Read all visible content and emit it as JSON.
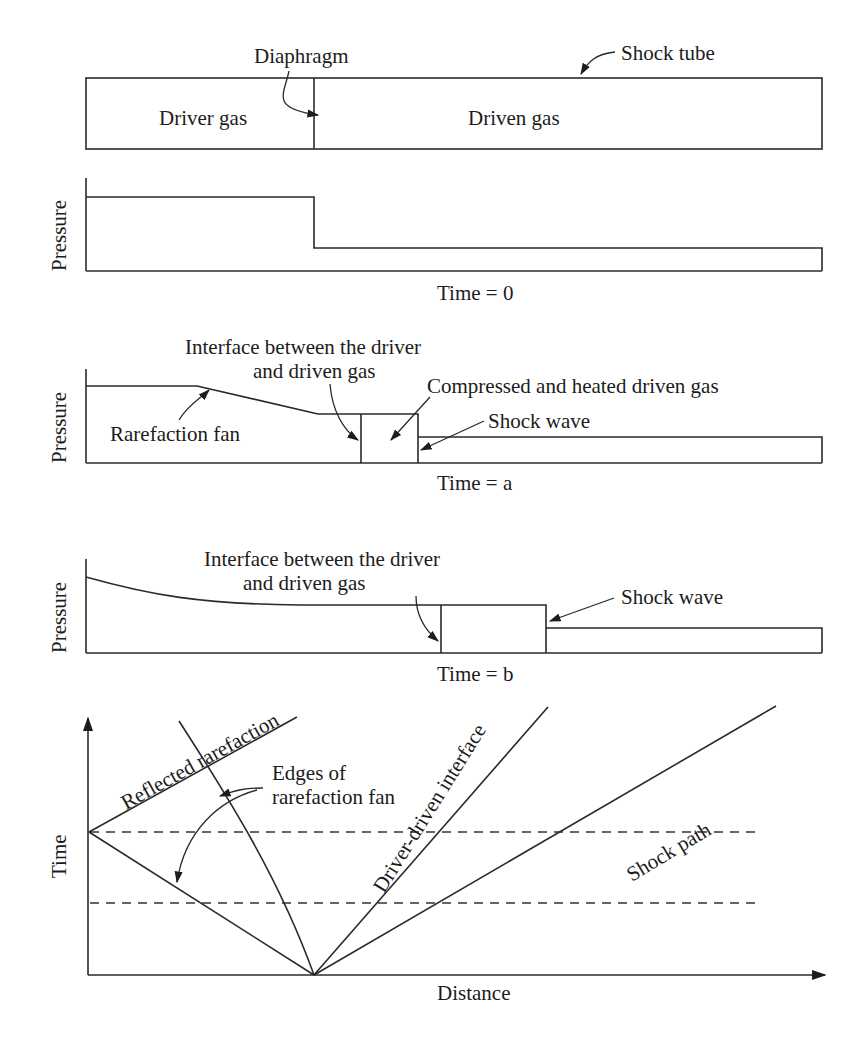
{
  "tube": {
    "title": "Shock tube",
    "diaphragm": "Diaphragm",
    "driver": "Driver gas",
    "driven": "Driven gas"
  },
  "panels": [
    {
      "id": "t0",
      "ylabel": "Pressure",
      "caption": "Time = 0"
    },
    {
      "id": "ta",
      "ylabel": "Pressure",
      "caption": "Time = a",
      "annotations": {
        "interface_line1": "Interface between the driver",
        "interface_line2": "and driven gas",
        "compressed": "Compressed and heated driven gas",
        "shock": "Shock wave",
        "rarefaction": "Rarefaction fan"
      }
    },
    {
      "id": "tb",
      "ylabel": "Pressure",
      "caption": "Time = b",
      "annotations": {
        "interface_line1": "Interface between the driver",
        "interface_line2": "and driven gas",
        "shock": "Shock wave"
      }
    }
  ],
  "xt": {
    "ylabel": "Time",
    "xlabel": "Distance",
    "reflected": "Reflected rarefaction",
    "edges_line1": "Edges of",
    "edges_line2": "rarefaction fan",
    "interface": "Driver-driven interface",
    "shock": "Shock path"
  }
}
